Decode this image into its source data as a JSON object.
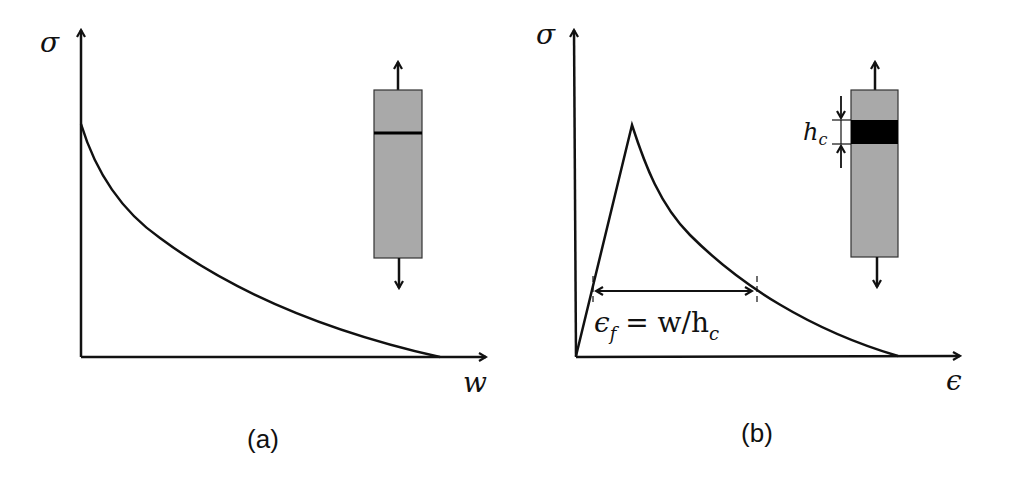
{
  "panels": [
    {
      "id": "a",
      "caption": "(a)",
      "y_axis_label": "σ",
      "x_axis_label": "w",
      "curve": "softening curve: stress σ decreases monotonically from a maximum at w=0 to zero",
      "inset": {
        "type": "specimen bar with crack line",
        "fill": "#a9a9a9"
      }
    },
    {
      "id": "b",
      "caption": "(b)",
      "y_axis_label": "σ",
      "x_axis_label": "ϵ",
      "curve": "linear rise to peak, then softening decay to zero",
      "annotation": "ϵ_f = w/h_c",
      "annotation_parts": {
        "eps": "ϵ",
        "sub_f": "f",
        "eq": " = w/h",
        "sub_c": "c"
      },
      "inset": {
        "type": "specimen bar with crack band",
        "band_label": "h",
        "band_label_sub": "c",
        "fill": "#a9a9a9",
        "band_color": "#000000"
      }
    }
  ],
  "colors": {
    "line": "#111111",
    "box": "#a9a9a9",
    "band": "#000000",
    "background": "#ffffff"
  }
}
